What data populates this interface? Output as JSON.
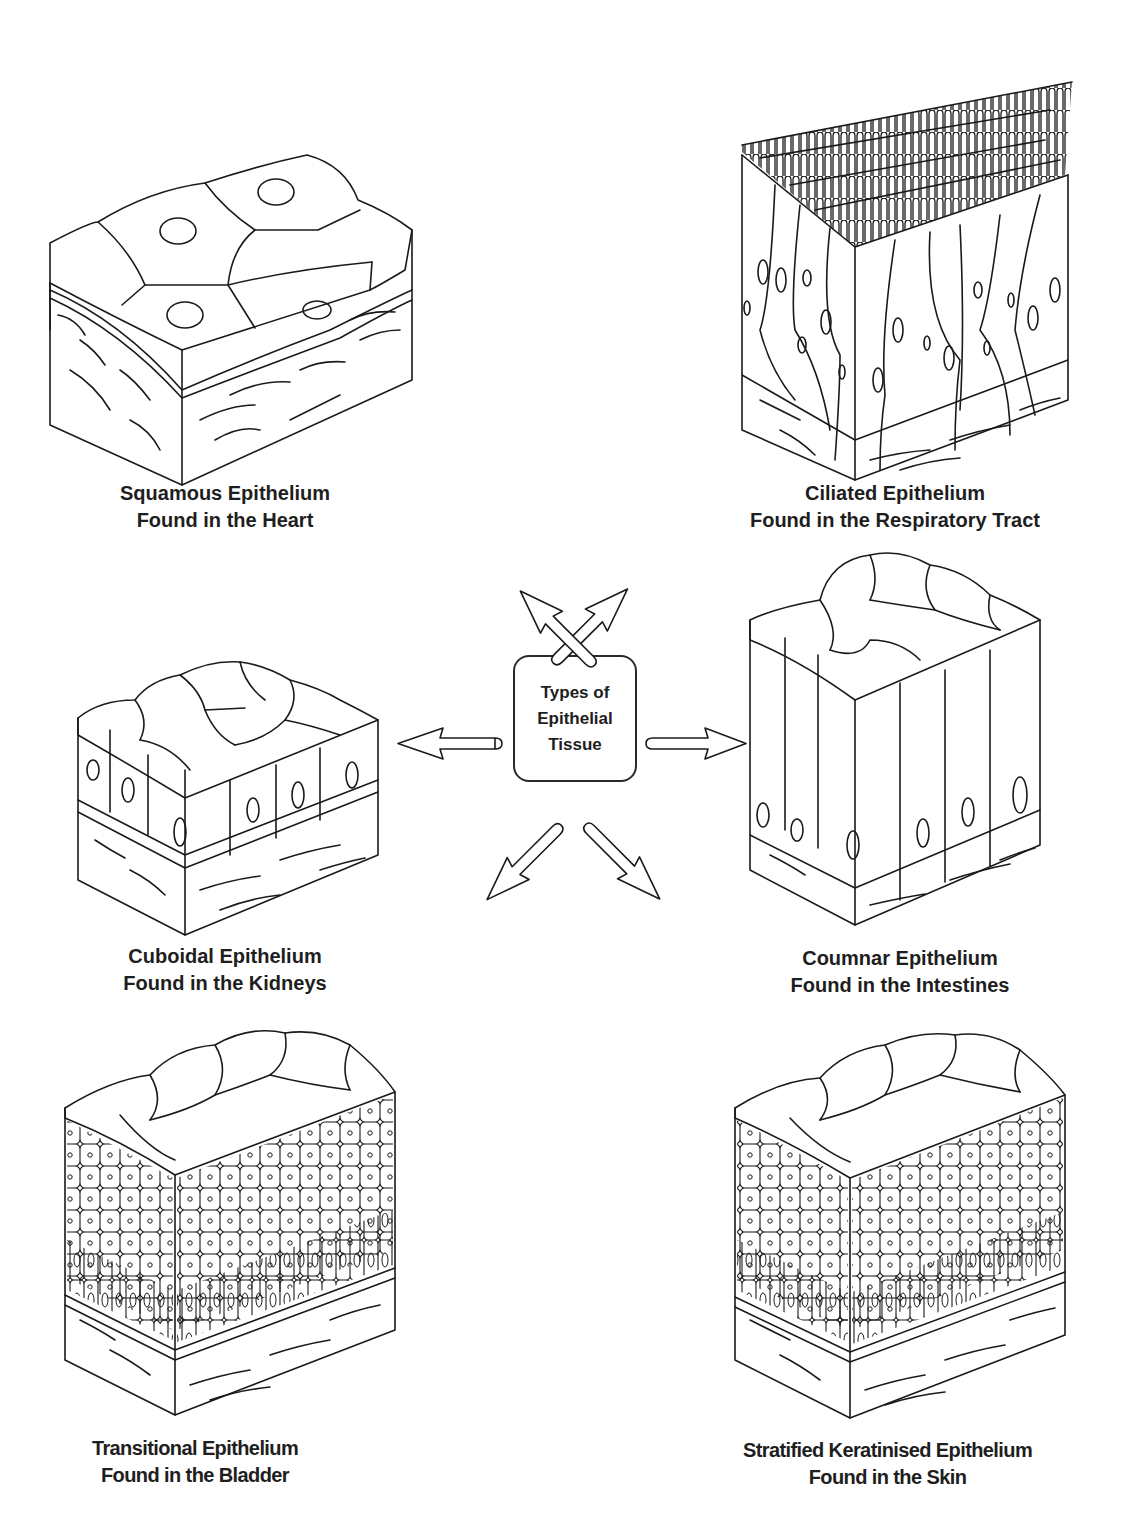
{
  "center": {
    "title_lines": [
      "Types of",
      "Epithelial",
      "Tissue"
    ]
  },
  "panels": [
    {
      "id": "squamous",
      "name": "Squamous Epithelium",
      "location": "Found in the Heart"
    },
    {
      "id": "ciliated",
      "name": "Ciliated Epithelium",
      "location": "Found in the Respiratory Tract"
    },
    {
      "id": "cuboidal",
      "name": "Cuboidal Epithelium",
      "location": "Found in the Kidneys"
    },
    {
      "id": "columnar",
      "name": "Coumnar Epithelium",
      "location": "Found in the Intestines"
    },
    {
      "id": "transitional",
      "name": "Transitional Epithelium",
      "location": "Found in the Bladder"
    },
    {
      "id": "stratified",
      "name": "Stratified Keratinised Epithelium",
      "location": "Found in the Skin"
    }
  ],
  "arrows": [
    "up-left",
    "up-right",
    "left",
    "right",
    "down-left",
    "down-right"
  ],
  "colors": {
    "line": "#1a1a1a",
    "background": "#ffffff",
    "text": "#1e1e1e"
  }
}
